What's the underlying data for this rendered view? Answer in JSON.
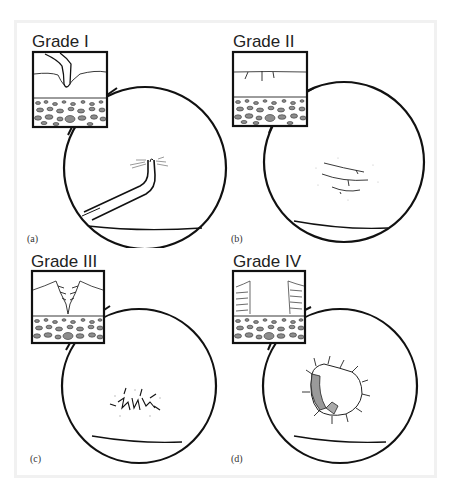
{
  "figure": {
    "panels": [
      {
        "id": "a",
        "letter": "(a)",
        "grade": "Grade I",
        "description": "Indentation/softening of cartilage surface; probe presses into surface"
      },
      {
        "id": "b",
        "letter": "(b)",
        "grade": "Grade II",
        "description": "Superficial fissures/fibrillation in cartilage"
      },
      {
        "id": "c",
        "letter": "(c)",
        "grade": "Grade III",
        "description": "Deep fissures extending toward subchondral bone"
      },
      {
        "id": "d",
        "letter": "(d)",
        "grade": "Grade IV",
        "description": "Full-thickness defect exposing subchondral bone"
      }
    ]
  },
  "colors": {
    "line": "#111111",
    "frame": "#f1f1f1",
    "bone_fill": "#8c8c8c",
    "exposed_bone": "#9a9a9a"
  }
}
